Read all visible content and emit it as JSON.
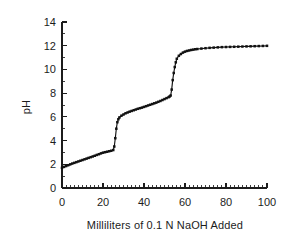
{
  "chart_data": {
    "type": "line",
    "title": "",
    "xlabel": "Milliliters of 0.1 N NaOH Added",
    "ylabel": "pH",
    "xlim": [
      0,
      100
    ],
    "ylim": [
      0,
      14
    ],
    "x_major_ticks": [
      0,
      20,
      40,
      60,
      80,
      100
    ],
    "x_tick_labels": [
      "0",
      "20",
      "40",
      "60",
      "80",
      "100"
    ],
    "x_minor_step": 2,
    "y_major_ticks": [
      0,
      2,
      4,
      6,
      8,
      10,
      12,
      14
    ],
    "y_tick_labels": [
      "0",
      "2",
      "4",
      "6",
      "8",
      "10",
      "12",
      "14"
    ],
    "y_minor_step": 1,
    "grid": false,
    "legend": "none",
    "marker": "square",
    "line_color": "#111111",
    "marker_color": "#111111",
    "series": [
      {
        "name": "Titration curve",
        "x": [
          0,
          1,
          2,
          3,
          4,
          5,
          6,
          7,
          8,
          9,
          10,
          11,
          12,
          13,
          14,
          15,
          16,
          17,
          18,
          19,
          20,
          21,
          22,
          23,
          24,
          25,
          25.5,
          26,
          26.5,
          27,
          27.5,
          28,
          29,
          30,
          31,
          32,
          33,
          34,
          35,
          36,
          37,
          38,
          39,
          40,
          41,
          42,
          43,
          44,
          45,
          46,
          47,
          48,
          49,
          50,
          51,
          52,
          52.5,
          53,
          53.5,
          54,
          54.5,
          55,
          55.5,
          56,
          57,
          58,
          59,
          60,
          61,
          62,
          63,
          64,
          65,
          66,
          68,
          70,
          72,
          74,
          76,
          78,
          80,
          82,
          84,
          86,
          88,
          90,
          92,
          94,
          96,
          98,
          100
        ],
        "y": [
          1.7,
          1.78,
          1.85,
          1.92,
          1.99,
          2.06,
          2.12,
          2.18,
          2.24,
          2.3,
          2.36,
          2.42,
          2.48,
          2.54,
          2.6,
          2.66,
          2.72,
          2.79,
          2.85,
          2.92,
          2.98,
          3.02,
          3.06,
          3.1,
          3.14,
          3.2,
          3.5,
          4.2,
          5.0,
          5.55,
          5.8,
          5.95,
          6.1,
          6.2,
          6.3,
          6.37,
          6.44,
          6.5,
          6.56,
          6.62,
          6.68,
          6.73,
          6.78,
          6.84,
          6.9,
          6.96,
          7.02,
          7.08,
          7.14,
          7.2,
          7.27,
          7.34,
          7.42,
          7.5,
          7.58,
          7.66,
          7.72,
          7.8,
          8.3,
          9.1,
          9.7,
          10.2,
          10.6,
          10.9,
          11.15,
          11.3,
          11.42,
          11.5,
          11.56,
          11.6,
          11.64,
          11.67,
          11.7,
          11.72,
          11.76,
          11.79,
          11.82,
          11.84,
          11.86,
          11.88,
          11.89,
          11.9,
          11.91,
          11.92,
          11.93,
          11.94,
          11.95,
          11.96,
          11.97,
          11.98,
          11.99
        ]
      }
    ]
  },
  "figure": {
    "background_color": "#ffffff",
    "axis_color": "#1c1c1c"
  }
}
